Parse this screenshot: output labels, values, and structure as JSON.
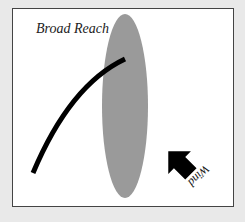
{
  "diagram": {
    "title": "Broad Reach",
    "wind_label": "Wind",
    "colors": {
      "background": "#e9e9e9",
      "frame": "#ffffff",
      "hull": "#9a9a9a",
      "sail": "#000000",
      "arrow": "#000000"
    },
    "elements": {
      "hull": "boat hull (top view)",
      "sail": "sail trimmed out for broad reach",
      "wind_arrow": "wind direction arrow from lower right"
    }
  }
}
